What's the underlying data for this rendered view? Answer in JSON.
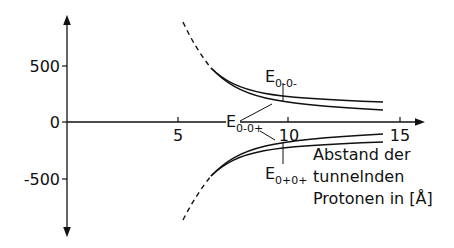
{
  "diagram": {
    "type": "energy-splitting-vs-distance",
    "y_axis": {
      "ticks": [
        {
          "value": 500,
          "label": "500"
        },
        {
          "value": 0,
          "label": "0"
        },
        {
          "value": -500,
          "label": "-500"
        }
      ]
    },
    "x_axis": {
      "ticks": [
        {
          "value": 5,
          "label": "5"
        },
        {
          "value": 10,
          "label": "10"
        },
        {
          "value": 15,
          "label": "15"
        }
      ],
      "label_lines": [
        "Abstand der",
        "tunnelnden",
        "Protonen in [Å]"
      ]
    },
    "curve_labels": {
      "e00minus": {
        "base": "E",
        "sub": "0-0-"
      },
      "e00plus": {
        "base": "E",
        "sub": "0-0+"
      },
      "e0p0p": {
        "base": "E",
        "sub": "0+0+"
      }
    },
    "colors": {
      "ink": "#111111"
    }
  }
}
